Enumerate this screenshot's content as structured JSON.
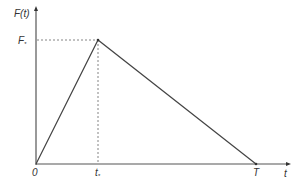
{
  "diagram": {
    "type": "triangular-pulse",
    "y_axis_label": "F(t)",
    "x_axis_label": "t",
    "peak_label": "F",
    "peak_label_sub": "*",
    "origin_label": "0",
    "peak_time_label": "t",
    "peak_time_sub": "*",
    "end_time_label": "T",
    "points": [
      {
        "t": "0",
        "F": "0"
      },
      {
        "t": "t*",
        "F": "F*"
      },
      {
        "t": "T",
        "F": "0"
      }
    ],
    "colors": {
      "axis": "#555555",
      "line": "#444444",
      "dashed": "#666666",
      "text": "#333333"
    }
  }
}
